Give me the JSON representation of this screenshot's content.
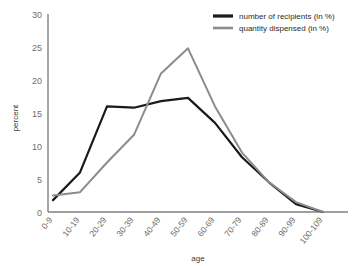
{
  "chart_data": {
    "type": "line",
    "title": "",
    "xlabel": "age",
    "ylabel": "percent",
    "categories": [
      "0-9",
      "10-19",
      "20-29",
      "30-39",
      "40-49",
      "50-59",
      "60-69",
      "70-79",
      "80-89",
      "90-99",
      "100-109"
    ],
    "ylim": [
      0,
      30
    ],
    "yticks": [
      0,
      5,
      10,
      15,
      20,
      25,
      30
    ],
    "grid": false,
    "legend_position": "top-right",
    "series": [
      {
        "name": "number of recipients (in %)",
        "color": "#1a1a1a",
        "values": [
          1.8,
          6.0,
          16.0,
          15.8,
          16.8,
          17.3,
          13.5,
          8.3,
          4.5,
          1.2,
          0.0
        ]
      },
      {
        "name": "quantity dispensed (in %)",
        "color": "#8c8c8c",
        "values": [
          2.5,
          3.0,
          7.5,
          11.7,
          21.0,
          24.8,
          16.0,
          9.0,
          4.5,
          1.5,
          0.0
        ]
      }
    ]
  },
  "axis": {
    "y_title": "percent",
    "x_title": "age"
  },
  "colors": {
    "axis_line": "#808080",
    "tick_text": "#6e6e6e",
    "series_1": "#1a1a1a",
    "series_2": "#8c8c8c"
  }
}
